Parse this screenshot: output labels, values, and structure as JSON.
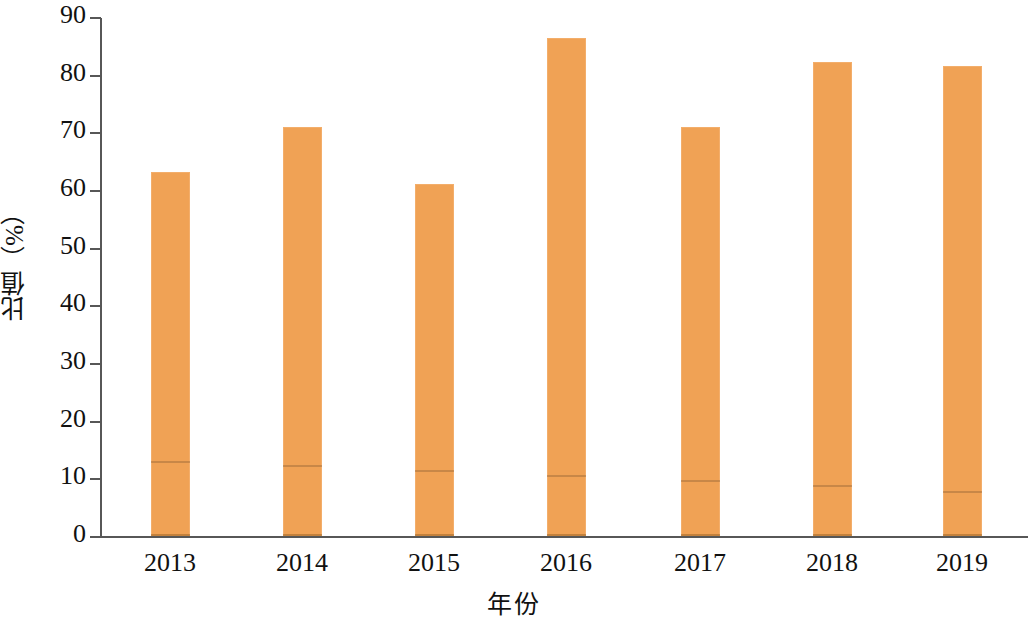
{
  "chart_data": {
    "type": "bar",
    "title": "",
    "xlabel": "年份",
    "ylabel": "比值（%）",
    "categories": [
      "2013",
      "2014",
      "2015",
      "2016",
      "2017",
      "2018",
      "2019"
    ],
    "values": [
      63.3,
      71.1,
      61.2,
      86.6,
      71.1,
      82.3,
      81.6
    ],
    "series": [
      {
        "name": "比值",
        "values": [
          63.3,
          71.1,
          61.2,
          86.6,
          71.1,
          82.3,
          81.6
        ]
      },
      {
        "name": "下层分界线",
        "values": [
          13.0,
          12.3,
          11.4,
          10.6,
          9.7,
          8.8,
          7.8
        ]
      }
    ],
    "ytick_labels": [
      "90",
      "80",
      "70",
      "60",
      "50",
      "40",
      "30",
      "20",
      "10",
      "0"
    ],
    "ytick_values": [
      90,
      80,
      70,
      60,
      50,
      40,
      30,
      20,
      10,
      0
    ],
    "ylim": [
      0,
      90
    ],
    "grid": false,
    "legend": "none",
    "bar_color": "#f0a255",
    "axis_color": "#575757"
  }
}
